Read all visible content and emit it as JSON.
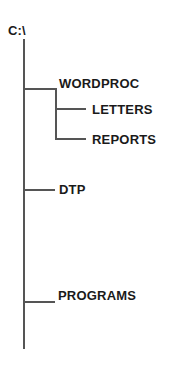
{
  "diagram": {
    "type": "directory-tree",
    "line_color": "#555555",
    "text_color": "#1a1a1a",
    "root": {
      "label": "C:\\",
      "children": [
        {
          "label": "WORDPROC",
          "children": [
            {
              "label": "LETTERS"
            },
            {
              "label": "REPORTS"
            }
          ]
        },
        {
          "label": "DTP"
        },
        {
          "label": "PROGRAMS"
        }
      ]
    }
  }
}
